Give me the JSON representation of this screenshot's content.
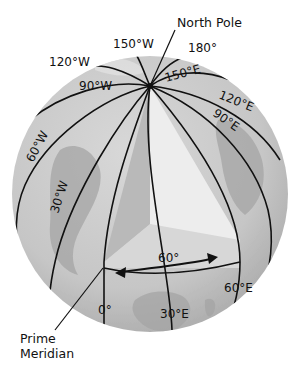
{
  "diagram": {
    "title_fragment": "",
    "labels": {
      "north_pole": "North Pole",
      "prime_meridian_line1": "Prime",
      "prime_meridian_line2": "Meridian",
      "angle": "60°"
    },
    "meridians": {
      "m180": "180°",
      "m150w": "150°W",
      "m120w": "120°W",
      "m90w": "90°W",
      "m60w": "60°W",
      "m30w": "30°W",
      "m0": "0°",
      "m30e": "30°E",
      "m60e": "60°E",
      "m90e": "90°E",
      "m120e": "120°E",
      "m150e": "150°E"
    },
    "colors": {
      "globe_fill": "#c9c9c9",
      "globe_shade": "#b3b3b3",
      "land": "#9c9c9c",
      "wedge_left": "#b9b9b9",
      "wedge_right": "#ececec",
      "wedge_floor": "#d6d6d6",
      "line": "#111111"
    }
  }
}
